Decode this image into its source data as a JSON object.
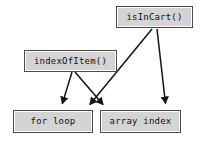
{
  "diagram": {
    "type": "call-graph",
    "background_color": "#ffffff",
    "node_fill_color": "#d4d4d4",
    "node_border_color": "#4a4a4a",
    "edge_color": "#141414",
    "text_color": "#111111",
    "nodes": [
      {
        "id": "isincart",
        "label": "isInCart()",
        "role": "caller",
        "x": 116,
        "y": 6,
        "w": 77,
        "h": 22
      },
      {
        "id": "indexofitem",
        "label": "indexOfItem()",
        "role": "caller",
        "x": 24,
        "y": 50,
        "w": 93,
        "h": 22
      },
      {
        "id": "forloop",
        "label": "for loop",
        "role": "callee",
        "x": 13,
        "y": 110,
        "w": 80,
        "h": 23
      },
      {
        "id": "arrayindex",
        "label": "array index",
        "role": "callee",
        "x": 100,
        "y": 110,
        "w": 81,
        "h": 23
      }
    ],
    "edges": [
      {
        "id": "edge-indexofitem-forloop",
        "from": "indexofitem",
        "to": "forloop",
        "from_point": [
          72,
          72
        ],
        "to_point": [
          61,
          108
        ],
        "arrowhead": "filled-triangle"
      },
      {
        "id": "edge-indexofitem-arrayindex",
        "from": "indexofitem",
        "to": "arrayindex",
        "from_point": [
          75,
          72
        ],
        "to_point": [
          106,
          108
        ],
        "arrowhead": "filled-triangle"
      },
      {
        "id": "edge-isincart-forloop",
        "from": "isincart",
        "to": "forloop",
        "from_point": [
          152,
          29
        ],
        "to_point": [
          87,
          108
        ],
        "arrowhead": "filled-triangle"
      },
      {
        "id": "edge-isincart-arrayindex",
        "from": "isincart",
        "to": "arrayindex",
        "from_point": [
          157,
          29
        ],
        "to_point": [
          166,
          108
        ],
        "arrowhead": "filled-triangle"
      }
    ]
  }
}
